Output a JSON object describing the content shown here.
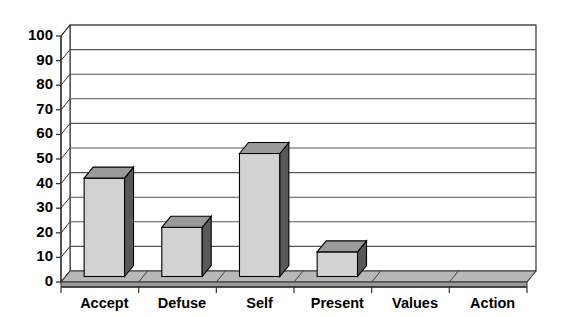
{
  "chart_data": {
    "type": "bar",
    "title": "",
    "subtitle": "",
    "xlabel": "",
    "ylabel": "",
    "categories": [
      "Accept",
      "Defuse",
      "Self",
      "Present",
      "Values",
      "Action"
    ],
    "values": [
      40,
      20,
      50,
      10,
      0,
      0
    ],
    "series": [
      {
        "name": "Series 1",
        "values": [
          40,
          20,
          50,
          10,
          0,
          0
        ]
      }
    ],
    "ylim": [
      0,
      100
    ],
    "ytick_labels": [
      "0",
      "10",
      "20",
      "30",
      "40",
      "50",
      "60",
      "70",
      "80",
      "90",
      "100"
    ],
    "ytick_values": [
      0,
      10,
      20,
      30,
      40,
      50,
      60,
      70,
      80,
      90,
      100
    ],
    "ytick_interval": 10,
    "grid": true,
    "grid_axis": "y",
    "legend": false,
    "legend_position": "none",
    "three_d": true,
    "annotations": [],
    "colors": {
      "bar_front": "#d2d2d2",
      "bar_side": "#585858",
      "bar_top": "#9a9a9a",
      "bar_outline": "#000000",
      "floor_front": "#9a9a9a",
      "floor_top": "#b8b8b8",
      "wall_fill": "#ffffff",
      "gridline": "#555555",
      "axis": "#333333",
      "text": "#000000",
      "background": "#ffffff"
    }
  }
}
